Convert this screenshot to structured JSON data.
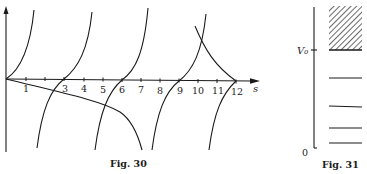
{
  "figures": [
    {
      "caption": "Fig. 30",
      "x_axis": {
        "label": "s",
        "ticks": [
          "1",
          "3",
          "4",
          "5",
          "6",
          "7",
          "8",
          "9",
          "10",
          "11",
          "12"
        ],
        "tick_positions": [
          1,
          2,
          3,
          4,
          5,
          6,
          7,
          8,
          9,
          10,
          11,
          12
        ]
      },
      "curves": [
        {
          "name": "tan-branch-1",
          "description": "rising branch from origin, asymptote near s≈1.5"
        },
        {
          "name": "tan-branch-2",
          "description": "rising branch crossing axis at s=3"
        },
        {
          "name": "tan-branch-3",
          "description": "rising branch crossing axis at s=6"
        },
        {
          "name": "tan-branch-4",
          "description": "rising branch crossing axis at s=9"
        },
        {
          "name": "tan-branch-5",
          "description": "rising branch crossing axis at s=12"
        },
        {
          "name": "decreasing-curve-1",
          "description": "falling curve from origin, descending steeply near s≈7"
        },
        {
          "name": "decreasing-curve-2",
          "description": "falling curve from s≈9.8 top down to axis at s=12"
        }
      ]
    },
    {
      "caption": "Fig. 31",
      "axis_labels": {
        "top": "V₀",
        "bottom": "0"
      },
      "continuum_region": "hatched band above V₀",
      "energy_levels": 4
    }
  ]
}
